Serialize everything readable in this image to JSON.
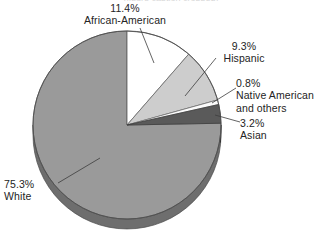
{
  "figure": {
    "top_cut_label": "(figure caption cropped)",
    "background_color": "#ffffff",
    "text_color": "#242424"
  },
  "chart_data": {
    "type": "pie",
    "title": "",
    "xlabel": "",
    "ylabel": "",
    "units": "percent",
    "start_angle_deg": 0,
    "direction": "clockwise",
    "three_d": true,
    "legend": "none (direct labels with leader lines)",
    "grid": false,
    "categories": [
      "African-American",
      "Hispanic",
      "Native American and others",
      "Asian",
      "White"
    ],
    "values": [
      11.4,
      9.3,
      0.8,
      3.2,
      75.3
    ],
    "slices": [
      {
        "label": "African-American",
        "value": 11.4,
        "value_text": "11.4%",
        "color": "#ffffff",
        "side_color": "#d9d9d9",
        "order": 1
      },
      {
        "label": "Hispanic",
        "value": 9.3,
        "value_text": "9.3%",
        "color": "#cdcdcd",
        "side_color": "#9c9c9c",
        "order": 2
      },
      {
        "label": "Native American and others",
        "label_line1": "Native American",
        "label_line2": "and others",
        "value": 0.8,
        "value_text": "0.8%",
        "color": "#fbfbfb",
        "side_color": "#c0c0c0",
        "order": 3
      },
      {
        "label": "Asian",
        "value": 3.2,
        "value_text": "3.2%",
        "color": "#5a5a5a",
        "side_color": "#3d3d3d",
        "order": 4
      },
      {
        "label": "White",
        "value": 75.3,
        "value_text": "75.3%",
        "color": "#9a9a9a",
        "side_color": "#6e6e6e",
        "order": 5
      }
    ]
  },
  "labels": {
    "african": {
      "pct": "11.4%",
      "name": "African-American"
    },
    "hispanic": {
      "pct": "9.3%",
      "name": "Hispanic"
    },
    "native": {
      "pct": "0.8%",
      "name": "Native American",
      "name2": "and others"
    },
    "asian": {
      "pct": "3.2%",
      "name": "Asian"
    },
    "white": {
      "pct": "75.3%",
      "name": "White"
    }
  }
}
